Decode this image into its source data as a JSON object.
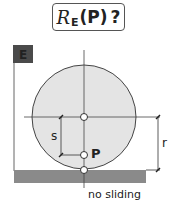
{
  "title": {
    "script_symbol": "R",
    "subscript": "E",
    "argument": "(P)",
    "question_mark": "?"
  },
  "frame_badge": {
    "label": "E",
    "color": "#4a4a4a"
  },
  "labels": {
    "s": "s",
    "r": "r",
    "point": "P",
    "ground": "no sliding"
  },
  "colors": {
    "disk_fill": "#e4e4e4",
    "ground_fill": "#8a8a8a",
    "line": "#333333"
  }
}
